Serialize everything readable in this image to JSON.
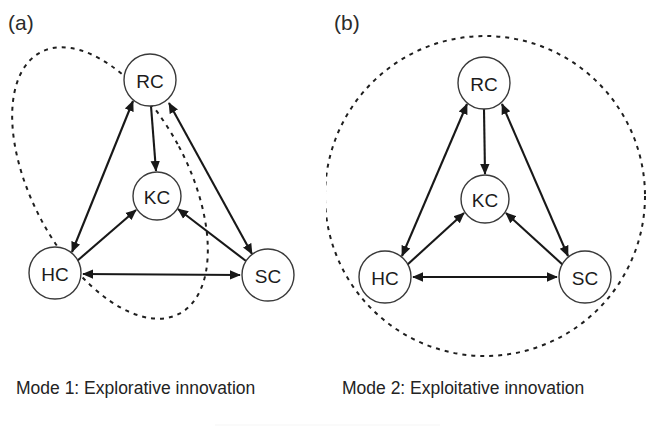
{
  "figure": {
    "title": "",
    "background_color": "#ffffff",
    "stroke_color": "#181818",
    "node_fill": "#ffffff"
  },
  "panels": [
    {
      "key": "a",
      "label": "(a)",
      "caption": "Mode 1: Explorative innovation",
      "grouping": {
        "shape": "ellipse",
        "style": "dashed",
        "encloses": [
          "RC",
          "KC",
          "HC"
        ],
        "excludes": [
          "SC"
        ],
        "rotation_deg": -28
      },
      "nodes": [
        {
          "id": "RC",
          "label": "RC",
          "cx": 150,
          "cy": 80,
          "r": 26
        },
        {
          "id": "KC",
          "label": "KC",
          "cx": 157,
          "cy": 196,
          "r": 24
        },
        {
          "id": "HC",
          "label": "HC",
          "cx": 55,
          "cy": 273,
          "r": 26
        },
        {
          "id": "SC",
          "label": "SC",
          "cx": 268,
          "cy": 275,
          "r": 26
        }
      ],
      "edges": [
        {
          "from": "RC",
          "to": "KC",
          "direction": "one-way"
        },
        {
          "from": "HC",
          "to": "RC",
          "direction": "two-way"
        },
        {
          "from": "RC",
          "to": "SC",
          "direction": "two-way"
        },
        {
          "from": "HC",
          "to": "KC",
          "direction": "one-way"
        },
        {
          "from": "SC",
          "to": "KC",
          "direction": "one-way"
        },
        {
          "from": "HC",
          "to": "SC",
          "direction": "two-way"
        }
      ]
    },
    {
      "key": "b",
      "label": "(b)",
      "caption": "Mode 2: Exploitative innovation",
      "grouping": {
        "shape": "circle",
        "style": "dashed",
        "encloses": [
          "RC",
          "KC",
          "HC",
          "SC"
        ],
        "excludes": [],
        "rotation_deg": 0
      },
      "nodes": [
        {
          "id": "RC",
          "label": "RC",
          "cx": 158,
          "cy": 83,
          "r": 26
        },
        {
          "id": "KC",
          "label": "KC",
          "cx": 159,
          "cy": 199,
          "r": 24
        },
        {
          "id": "HC",
          "label": "HC",
          "cx": 59,
          "cy": 277,
          "r": 26
        },
        {
          "id": "SC",
          "label": "SC",
          "cx": 259,
          "cy": 277,
          "r": 26
        }
      ],
      "edges": [
        {
          "from": "RC",
          "to": "KC",
          "direction": "one-way"
        },
        {
          "from": "HC",
          "to": "RC",
          "direction": "two-way"
        },
        {
          "from": "RC",
          "to": "SC",
          "direction": "two-way"
        },
        {
          "from": "HC",
          "to": "KC",
          "direction": "one-way"
        },
        {
          "from": "SC",
          "to": "KC",
          "direction": "one-way"
        },
        {
          "from": "HC",
          "to": "SC",
          "direction": "two-way"
        }
      ]
    }
  ],
  "legend_keys": {
    "RC": "RC",
    "KC": "KC",
    "HC": "HC",
    "SC": "SC"
  }
}
